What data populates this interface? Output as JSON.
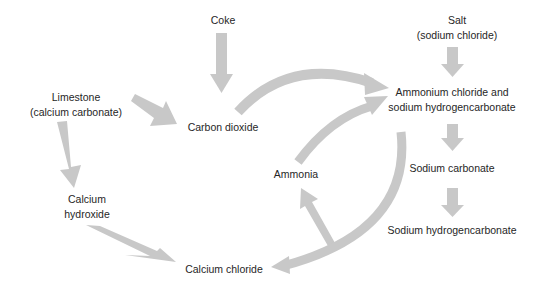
{
  "diagram": {
    "arrow_color": "#c8c8c8",
    "nodes": {
      "coke": {
        "lines": [
          "Coke"
        ]
      },
      "limestone": {
        "lines": [
          "Limestone",
          "(calcium carbonate)"
        ]
      },
      "carbon_dioxide": {
        "lines": [
          "Carbon dioxide"
        ]
      },
      "salt": {
        "lines": [
          "Salt",
          "(sodium chloride)"
        ]
      },
      "ammonium_chloride": {
        "lines": [
          "Ammonium chloride and",
          "sodium hydrogencarbonate"
        ]
      },
      "sodium_carbonate": {
        "lines": [
          "Sodium carbonate"
        ]
      },
      "sodium_hydrogencarbonate": {
        "lines": [
          "Sodium hydrogencarbonate"
        ]
      },
      "ammonia": {
        "lines": [
          "Ammonia"
        ]
      },
      "calcium_hydroxide": {
        "lines": [
          "Calcium",
          "hydroxide"
        ]
      },
      "calcium_chloride": {
        "lines": [
          "Calcium chloride"
        ]
      }
    },
    "edges": [
      {
        "from": "Coke",
        "to": "Carbon dioxide"
      },
      {
        "from": "Limestone (calcium carbonate)",
        "to": "Carbon dioxide"
      },
      {
        "from": "Limestone (calcium carbonate)",
        "to": "Calcium hydroxide"
      },
      {
        "from": "Carbon dioxide",
        "to": "Ammonium chloride and sodium hydrogencarbonate"
      },
      {
        "from": "Salt (sodium chloride)",
        "to": "Ammonium chloride and sodium hydrogencarbonate"
      },
      {
        "from": "Ammonia",
        "to": "Ammonium chloride and sodium hydrogencarbonate"
      },
      {
        "from": "Ammonium chloride and sodium hydrogencarbonate",
        "to": "Sodium carbonate"
      },
      {
        "from": "Sodium carbonate",
        "to": "Sodium hydrogencarbonate"
      },
      {
        "from": "Calcium hydroxide",
        "to": "Calcium chloride"
      },
      {
        "from": "Ammonium chloride and sodium hydrogencarbonate",
        "to": "Calcium chloride"
      },
      {
        "from": "Ammonium chloride and sodium hydrogencarbonate",
        "to": "Ammonia"
      }
    ]
  }
}
